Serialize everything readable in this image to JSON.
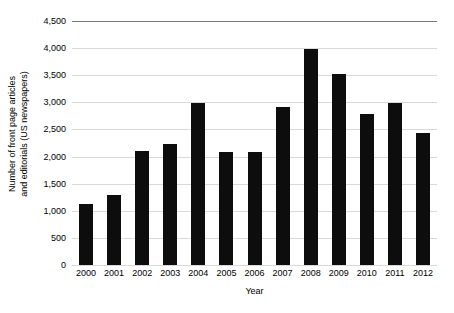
{
  "chart_data": {
    "type": "bar",
    "title": "",
    "xlabel": "Year",
    "ylabel_line1": "Number of front page articles",
    "ylabel_line2": "and editorials (US newspapers)",
    "ylabel": "Number of front page articles and editorials (US newspapers)",
    "categories": [
      "2000",
      "2001",
      "2002",
      "2003",
      "2004",
      "2005",
      "2006",
      "2007",
      "2008",
      "2009",
      "2010",
      "2011",
      "2012"
    ],
    "values": [
      1120,
      1290,
      2110,
      2230,
      2980,
      2090,
      2080,
      2920,
      3990,
      3520,
      2780,
      2980,
      2430
    ],
    "ylim": [
      0,
      4500
    ],
    "ytick_values": [
      0,
      500,
      1000,
      1500,
      2000,
      2500,
      3000,
      3500,
      4000,
      4500
    ],
    "ytick_labels": [
      "0",
      "500",
      "1,000",
      "1,500",
      "2,000",
      "2,500",
      "3,000",
      "3,500",
      "4,000",
      "4,500"
    ],
    "grid": true,
    "legend": "none",
    "bar_color": "#0d0d0d",
    "gridline_color": "#d9d9d9",
    "top_gridline_color": "#7a7a7a",
    "background_color": "#ffffff"
  }
}
